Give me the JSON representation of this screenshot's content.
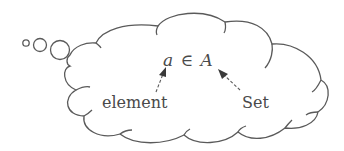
{
  "diagram": {
    "type": "thought-bubble",
    "expression": {
      "element_symbol": "a",
      "relation_symbol": "∈",
      "set_symbol": "A"
    },
    "annotations": [
      {
        "label": "element",
        "points_to": "a"
      },
      {
        "label": "Set",
        "points_to": "A"
      }
    ],
    "colors": {
      "stroke": "#555555",
      "text": "#4a4a4a",
      "background": "#ffffff"
    }
  }
}
